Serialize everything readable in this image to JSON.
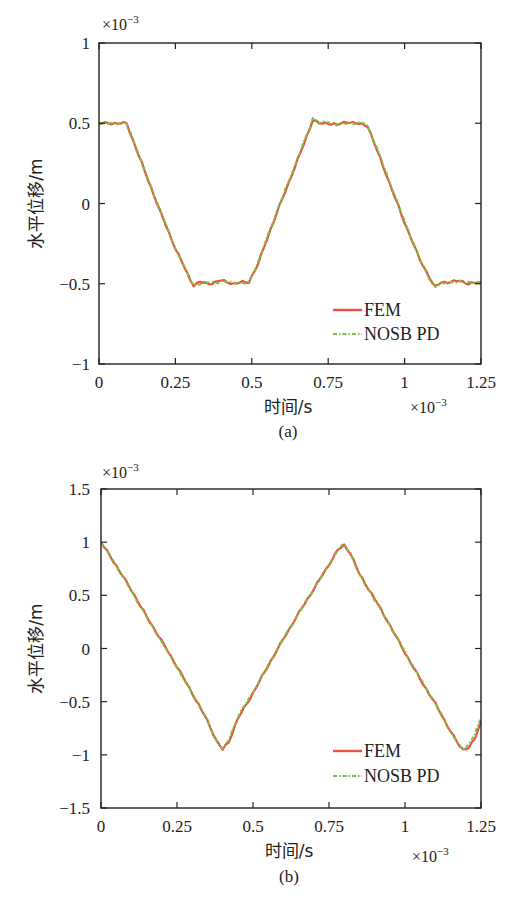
{
  "chart_data": [
    {
      "type": "line",
      "panel": "(a)",
      "caption": "(a)",
      "xlabel": "时间/s",
      "ylabel": "水平位移/m",
      "x_multiplier": "×10",
      "x_multiplier_exp": "−3",
      "y_multiplier": "×10",
      "y_multiplier_exp": "−3",
      "xlim": [
        0,
        1.25
      ],
      "ylim": [
        -1,
        1
      ],
      "xticks": [
        0,
        0.25,
        0.5,
        0.75,
        1,
        1.25
      ],
      "xtick_labels": [
        "0",
        "0.25",
        "0.5",
        "0.75",
        "1",
        "1.25"
      ],
      "yticks": [
        -1,
        -0.5,
        0,
        0.5,
        1
      ],
      "ytick_labels": [
        "−1",
        "−0.5",
        "0",
        "0.5",
        "1"
      ],
      "grid": false,
      "legend_position": "lower right",
      "series": [
        {
          "name": "FEM",
          "color": "#e8533f",
          "style": "solid",
          "x": [
            0,
            0.09,
            0.12,
            0.15,
            0.2,
            0.25,
            0.3,
            0.31,
            0.33,
            0.36,
            0.4,
            0.44,
            0.47,
            0.49,
            0.52,
            0.55,
            0.6,
            0.65,
            0.69,
            0.7,
            0.72,
            0.75,
            0.78,
            0.81,
            0.84,
            0.87,
            0.88,
            0.91,
            0.95,
            1.0,
            1.05,
            1.09,
            1.1,
            1.12,
            1.15,
            1.18,
            1.21,
            1.25
          ],
          "values": [
            0.5,
            0.5,
            0.35,
            0.2,
            -0.05,
            -0.28,
            -0.48,
            -0.51,
            -0.49,
            -0.5,
            -0.48,
            -0.5,
            -0.49,
            -0.49,
            -0.38,
            -0.22,
            0.03,
            0.27,
            0.47,
            0.52,
            0.5,
            0.5,
            0.49,
            0.51,
            0.5,
            0.49,
            0.48,
            0.33,
            0.13,
            -0.12,
            -0.35,
            -0.49,
            -0.52,
            -0.49,
            -0.49,
            -0.48,
            -0.5,
            -0.49
          ]
        },
        {
          "name": "NOSB PD",
          "color": "#7cc242",
          "style": "dash-dot",
          "x": [
            0,
            0.09,
            0.12,
            0.15,
            0.2,
            0.25,
            0.3,
            0.31,
            0.33,
            0.36,
            0.4,
            0.44,
            0.47,
            0.49,
            0.52,
            0.55,
            0.6,
            0.65,
            0.69,
            0.7,
            0.72,
            0.75,
            0.78,
            0.81,
            0.84,
            0.87,
            0.88,
            0.91,
            0.95,
            1.0,
            1.05,
            1.09,
            1.1,
            1.12,
            1.15,
            1.18,
            1.21,
            1.25
          ],
          "values": [
            0.5,
            0.5,
            0.36,
            0.2,
            -0.04,
            -0.28,
            -0.48,
            -0.51,
            -0.5,
            -0.49,
            -0.49,
            -0.49,
            -0.5,
            -0.49,
            -0.37,
            -0.21,
            0.04,
            0.28,
            0.48,
            0.53,
            0.5,
            0.51,
            0.49,
            0.5,
            0.5,
            0.5,
            0.48,
            0.34,
            0.14,
            -0.11,
            -0.35,
            -0.5,
            -0.52,
            -0.5,
            -0.49,
            -0.49,
            -0.49,
            -0.5
          ]
        }
      ]
    },
    {
      "type": "line",
      "panel": "(b)",
      "caption": "(b)",
      "xlabel": "时间/s",
      "ylabel": "水平位移/m",
      "x_multiplier": "×10",
      "x_multiplier_exp": "−3",
      "y_multiplier": "×10",
      "y_multiplier_exp": "−3",
      "xlim": [
        0,
        1.25
      ],
      "ylim": [
        -1.5,
        1.5
      ],
      "xticks": [
        0,
        0.25,
        0.5,
        0.75,
        1,
        1.25
      ],
      "xtick_labels": [
        "0",
        "0.25",
        "0.5",
        "0.75",
        "1",
        "1.25"
      ],
      "yticks": [
        -1.5,
        -1,
        -0.5,
        0,
        0.5,
        1,
        1.5
      ],
      "ytick_labels": [
        "−1.5",
        "−1",
        "−0.5",
        "0",
        "0.5",
        "1",
        "1.5"
      ],
      "grid": false,
      "legend_position": "lower right",
      "series": [
        {
          "name": "FEM",
          "color": "#e8533f",
          "style": "solid",
          "x": [
            0,
            0.05,
            0.1,
            0.15,
            0.2,
            0.25,
            0.3,
            0.35,
            0.38,
            0.4,
            0.42,
            0.45,
            0.5,
            0.55,
            0.6,
            0.65,
            0.7,
            0.75,
            0.78,
            0.8,
            0.82,
            0.85,
            0.9,
            0.95,
            1.0,
            1.05,
            1.1,
            1.15,
            1.18,
            1.19,
            1.21,
            1.23,
            1.25
          ],
          "values": [
            1.0,
            0.78,
            0.55,
            0.3,
            0.07,
            -0.17,
            -0.42,
            -0.68,
            -0.87,
            -0.95,
            -0.88,
            -0.66,
            -0.42,
            -0.16,
            0.09,
            0.33,
            0.56,
            0.79,
            0.93,
            0.97,
            0.9,
            0.7,
            0.47,
            0.22,
            -0.04,
            -0.29,
            -0.52,
            -0.78,
            -0.92,
            -0.95,
            -0.93,
            -0.85,
            -0.68
          ]
        },
        {
          "name": "NOSB PD",
          "color": "#7cc242",
          "style": "dash-dot",
          "x": [
            0,
            0.05,
            0.1,
            0.15,
            0.2,
            0.25,
            0.3,
            0.35,
            0.38,
            0.4,
            0.42,
            0.45,
            0.5,
            0.55,
            0.6,
            0.65,
            0.7,
            0.75,
            0.78,
            0.8,
            0.82,
            0.85,
            0.9,
            0.95,
            1.0,
            1.05,
            1.1,
            1.15,
            1.18,
            1.19,
            1.21,
            1.23,
            1.25
          ],
          "values": [
            1.0,
            0.78,
            0.54,
            0.3,
            0.06,
            -0.18,
            -0.42,
            -0.68,
            -0.87,
            -0.95,
            -0.86,
            -0.64,
            -0.41,
            -0.16,
            0.09,
            0.33,
            0.56,
            0.79,
            0.93,
            0.98,
            0.9,
            0.69,
            0.46,
            0.22,
            -0.03,
            -0.28,
            -0.52,
            -0.78,
            -0.92,
            -0.95,
            -0.9,
            -0.8,
            -0.66
          ]
        }
      ]
    }
  ]
}
